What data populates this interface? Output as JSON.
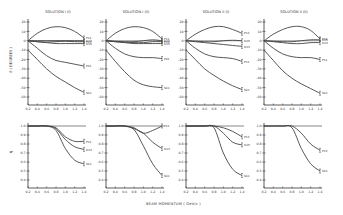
{
  "figure": {
    "xlabel": "BEAM MOMENTUM ( GeV/c )",
    "top_ylabel": "δ ( DEGREES )",
    "bottom_ylabel": "η"
  },
  "chart_data": [
    {
      "type": "line",
      "panel": "top-1",
      "title": "SOLUTION I (i)",
      "xlabel": "",
      "ylabel": "δ (DEGREES)",
      "xlim": [
        0.2,
        1.4
      ],
      "ylim": [
        -60,
        20
      ],
      "x_ticks": [
        "0.2",
        "0.4",
        "0.6",
        "0.8",
        "1.0",
        "1.2",
        "1.4"
      ],
      "y_ticks": [
        "20",
        "10",
        "0",
        "-10",
        "-20",
        "-30",
        "-40",
        "-50",
        "-60"
      ],
      "x": [
        0.2,
        0.4,
        0.6,
        0.8,
        1.0,
        1.2,
        1.4
      ],
      "series": [
        {
          "name": "P11",
          "values": [
            0,
            8,
            13,
            15,
            14,
            10,
            3
          ]
        },
        {
          "name": "D13",
          "values": [
            0,
            0,
            0,
            0,
            0,
            0,
            0
          ]
        },
        {
          "name": "P13",
          "values": [
            0,
            -1,
            -1.5,
            -1,
            -0.5,
            -1,
            -1
          ]
        },
        {
          "name": "D15",
          "values": [
            0,
            -1,
            -2,
            -3,
            -3,
            -3,
            -3
          ]
        },
        {
          "name": "P01",
          "values": [
            0,
            -8,
            -16,
            -21,
            -23,
            -25,
            -27
          ]
        },
        {
          "name": "S01",
          "values": [
            -10,
            -20,
            -30,
            -38,
            -44,
            -50,
            -55
          ]
        }
      ]
    },
    {
      "type": "line",
      "panel": "top-2",
      "title": "SOLUTION I (ii)",
      "xlim": [
        0.2,
        1.4
      ],
      "ylim": [
        -60,
        20
      ],
      "x_ticks": [
        "0.2",
        "0.4",
        "0.6",
        "0.8",
        "1.0",
        "1.2",
        "1.4"
      ],
      "y_ticks": [
        "20",
        "10",
        "0",
        "-10",
        "-20",
        "-30",
        "-40",
        "-50",
        "-60"
      ],
      "x": [
        0.2,
        0.4,
        0.6,
        0.8,
        1.0,
        1.2,
        1.4
      ],
      "series": [
        {
          "name": "P11",
          "values": [
            0,
            8,
            13,
            15,
            14,
            10,
            2
          ]
        },
        {
          "name": "D13",
          "values": [
            0,
            -0.5,
            -1,
            -1,
            0,
            1,
            0
          ]
        },
        {
          "name": "P13",
          "values": [
            0,
            -1,
            -1.5,
            -2,
            -2,
            -1,
            -1
          ]
        },
        {
          "name": "D15",
          "values": [
            0,
            -1,
            -2,
            -3,
            -3,
            -3,
            -3
          ]
        },
        {
          "name": "P01",
          "values": [
            0,
            -8,
            -14,
            -17,
            -18,
            -18,
            -19
          ]
        },
        {
          "name": "S01",
          "values": [
            -10,
            -22,
            -33,
            -42,
            -47,
            -49,
            -50
          ]
        }
      ]
    },
    {
      "type": "line",
      "panel": "top-3",
      "title": "SOLUTION II (i)",
      "xlim": [
        0.2,
        1.4
      ],
      "ylim": [
        -60,
        20
      ],
      "x_ticks": [
        "0.2",
        "0.4",
        "0.6",
        "0.8",
        "1.0",
        "1.2",
        "1.4"
      ],
      "y_ticks": [
        "20",
        "10",
        "0",
        "-10",
        "-20",
        "-30",
        "-40",
        "-50",
        "-60"
      ],
      "x": [
        0.2,
        0.4,
        0.6,
        0.8,
        1.0,
        1.2,
        1.4
      ],
      "series": [
        {
          "name": "P13",
          "values": [
            0,
            7,
            12,
            15,
            15,
            12,
            8
          ]
        },
        {
          "name": "D15",
          "values": [
            0,
            -0.5,
            -1,
            -1,
            0,
            0.5,
            0
          ]
        },
        {
          "name": "D13",
          "values": [
            0,
            -1,
            -2,
            -3,
            -4,
            -5,
            -6
          ]
        },
        {
          "name": "P11",
          "values": [
            0,
            -8,
            -14,
            -17,
            -18,
            -19,
            -22
          ]
        },
        {
          "name": "S01",
          "values": [
            -10,
            -20,
            -30,
            -37,
            -43,
            -48,
            -52
          ]
        }
      ]
    },
    {
      "type": "line",
      "panel": "top-4",
      "title": "SOLUTION II (ii)",
      "xlim": [
        0.2,
        1.4
      ],
      "ylim": [
        -60,
        20
      ],
      "x_ticks": [
        "0.2",
        "0.4",
        "0.6",
        "0.8",
        "1.0",
        "1.2",
        "1.4"
      ],
      "y_ticks": [
        "20",
        "10",
        "0",
        "-10",
        "-20",
        "-30",
        "-40",
        "-50",
        "-60"
      ],
      "x": [
        0.2,
        0.4,
        0.6,
        0.8,
        1.0,
        1.2,
        1.4
      ],
      "series": [
        {
          "name": "P13",
          "values": [
            0,
            7,
            12,
            15,
            15,
            11,
            2
          ]
        },
        {
          "name": "D15",
          "values": [
            0,
            -0.5,
            -1,
            -1,
            0,
            1,
            1
          ]
        },
        {
          "name": "D13",
          "values": [
            0,
            -1,
            -2,
            -3,
            -3,
            -2,
            -2
          ]
        },
        {
          "name": "P11",
          "values": [
            0,
            -8,
            -14,
            -17,
            -18,
            -18,
            -20
          ]
        },
        {
          "name": "S01",
          "values": [
            -10,
            -21,
            -32,
            -40,
            -46,
            -51,
            -56
          ]
        }
      ]
    },
    {
      "type": "line",
      "panel": "bottom-1",
      "title": "",
      "ylabel": "η",
      "xlim": [
        0.2,
        1.4
      ],
      "ylim": [
        0.4,
        1.0
      ],
      "x_ticks": [
        "0.2",
        "0.4",
        "0.6",
        "0.8",
        "1.0",
        "1.2",
        "1.4"
      ],
      "y_ticks": [
        "1.0",
        "0.9",
        "0.8",
        "0.7",
        "0.6",
        "0.5",
        "0.4"
      ],
      "x": [
        0.2,
        0.4,
        0.6,
        0.8,
        1.0,
        1.2,
        1.4
      ],
      "series": [
        {
          "name": "P11",
          "values": [
            1.0,
            1.0,
            1.0,
            0.98,
            0.88,
            0.83,
            0.83
          ]
        },
        {
          "name": "D13",
          "values": [
            1.0,
            1.0,
            1.0,
            0.97,
            0.85,
            0.77,
            0.74
          ]
        },
        {
          "name": "S01",
          "values": [
            1.0,
            1.0,
            1.0,
            0.95,
            0.75,
            0.62,
            0.58
          ]
        }
      ]
    },
    {
      "type": "line",
      "panel": "bottom-2",
      "title": "",
      "xlim": [
        0.2,
        1.4
      ],
      "ylim": [
        0.4,
        1.0
      ],
      "x_ticks": [
        "0.2",
        "0.4",
        "0.6",
        "0.8",
        "1.0",
        "1.2",
        "1.4"
      ],
      "y_ticks": [
        "1.0",
        "0.9",
        "0.8",
        "0.7",
        "0.6",
        "0.5",
        "0.4"
      ],
      "x": [
        0.2,
        0.4,
        0.6,
        0.8,
        1.0,
        1.2,
        1.4
      ],
      "series": [
        {
          "name": "P11",
          "values": [
            1.0,
            1.0,
            1.0,
            0.98,
            0.92,
            0.95,
            1.0
          ]
        },
        {
          "name": "D13",
          "values": [
            1.0,
            1.0,
            1.0,
            0.97,
            0.92,
            0.82,
            0.75
          ]
        },
        {
          "name": "S01",
          "values": [
            1.0,
            1.0,
            1.0,
            0.96,
            0.78,
            0.58,
            0.45
          ]
        }
      ]
    },
    {
      "type": "line",
      "panel": "bottom-3",
      "title": "",
      "xlim": [
        0.2,
        1.4
      ],
      "ylim": [
        0.4,
        1.0
      ],
      "x_ticks": [
        "0.2",
        "0.4",
        "0.6",
        "0.8",
        "1.0",
        "1.2",
        "1.4"
      ],
      "y_ticks": [
        "1.0",
        "0.9",
        "0.8",
        "0.7",
        "0.6",
        "0.5",
        "0.4"
      ],
      "x": [
        0.2,
        0.4,
        0.6,
        0.8,
        1.0,
        1.2,
        1.4
      ],
      "series": [
        {
          "name": "P13",
          "values": [
            1.0,
            1.0,
            1.0,
            1.0,
            0.98,
            0.94,
            0.88
          ]
        },
        {
          "name": "D15",
          "values": [
            1.0,
            1.0,
            1.0,
            1.0,
            0.92,
            0.82,
            0.79
          ]
        },
        {
          "name": "S01",
          "values": [
            1.0,
            1.0,
            1.0,
            0.98,
            0.7,
            0.52,
            0.45
          ]
        }
      ]
    },
    {
      "type": "line",
      "panel": "bottom-4",
      "title": "",
      "xlim": [
        0.2,
        1.4
      ],
      "ylim": [
        0.4,
        1.0
      ],
      "x_ticks": [
        "0.2",
        "0.4",
        "0.6",
        "0.8",
        "1.0",
        "1.2",
        "1.4"
      ],
      "y_ticks": [
        "1.0",
        "0.9",
        "0.8",
        "0.7",
        "0.6",
        "0.5",
        "0.4"
      ],
      "x": [
        0.2,
        0.4,
        0.6,
        0.8,
        1.0,
        1.2,
        1.4
      ],
      "series": [
        {
          "name": "P13",
          "values": [
            1.0,
            1.0,
            1.0,
            1.0,
            0.92,
            0.8,
            0.73
          ]
        },
        {
          "name": "S01",
          "values": [
            1.0,
            1.0,
            1.0,
            0.98,
            0.75,
            0.58,
            0.5
          ]
        }
      ]
    }
  ]
}
